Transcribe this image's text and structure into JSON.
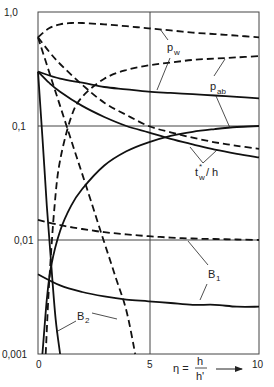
{
  "chart_data": {
    "type": "line",
    "title": "",
    "xlabel": "η = h/h'",
    "ylabel": "",
    "xscale": "linear",
    "yscale": "log",
    "xlim": [
      0,
      10
    ],
    "ylim": [
      0.001,
      1.0
    ],
    "grid": true,
    "x_ticks": [
      "0",
      "5",
      "10"
    ],
    "y_ticks": [
      "0,001",
      "0,01",
      "0,1",
      "1,0"
    ],
    "series": [
      {
        "name": "p_w (dashed)",
        "style": "dashed",
        "x": [
          0,
          0.5,
          1,
          1.5,
          2,
          3,
          4,
          5,
          6,
          7,
          8,
          9,
          10
        ],
        "values": [
          0.6,
          0.72,
          0.78,
          0.8,
          0.8,
          0.78,
          0.75,
          0.72,
          0.69,
          0.66,
          0.64,
          0.62,
          0.6
        ]
      },
      {
        "name": "p_w (solid)",
        "style": "solid",
        "x": [
          0,
          1,
          2,
          3,
          4,
          5,
          6,
          7,
          8,
          9,
          10
        ],
        "values": [
          0.3,
          0.26,
          0.24,
          0.22,
          0.21,
          0.2,
          0.195,
          0.19,
          0.185,
          0.18,
          0.175
        ]
      },
      {
        "name": "p_ab (dashed)",
        "style": "dashed",
        "x": [
          0.35,
          0.5,
          0.75,
          1,
          1.5,
          2,
          3,
          4,
          5,
          6,
          7,
          8,
          9,
          10
        ],
        "values": [
          0.001,
          0.004,
          0.02,
          0.05,
          0.12,
          0.18,
          0.26,
          0.31,
          0.34,
          0.36,
          0.38,
          0.39,
          0.4,
          0.41
        ]
      },
      {
        "name": "p_ab (solid)",
        "style": "solid",
        "x": [
          0.2,
          0.4,
          0.6,
          1,
          1.5,
          2,
          3,
          4,
          5,
          6,
          7,
          8,
          9,
          10
        ],
        "values": [
          0.001,
          0.003,
          0.006,
          0.012,
          0.02,
          0.028,
          0.045,
          0.06,
          0.072,
          0.082,
          0.089,
          0.094,
          0.098,
          0.1
        ]
      },
      {
        "name": "t_w*/h (dashed)",
        "style": "dashed",
        "x": [
          0,
          0.5,
          1,
          2,
          3,
          4,
          5,
          6,
          7,
          8,
          9,
          10
        ],
        "values": [
          0.6,
          0.45,
          0.35,
          0.23,
          0.16,
          0.125,
          0.1,
          0.088,
          0.079,
          0.072,
          0.067,
          0.063
        ]
      },
      {
        "name": "t_w*/h (solid)",
        "style": "solid",
        "x": [
          0,
          0.5,
          1,
          2,
          3,
          4,
          5,
          6,
          7,
          8,
          9,
          10
        ],
        "values": [
          0.3,
          0.24,
          0.2,
          0.15,
          0.12,
          0.1,
          0.088,
          0.077,
          0.069,
          0.062,
          0.057,
          0.053
        ]
      },
      {
        "name": "B1 (dashed)",
        "style": "dashed",
        "x": [
          0,
          1,
          2,
          3,
          4,
          5,
          6,
          7,
          8,
          9,
          10
        ],
        "values": [
          0.015,
          0.0135,
          0.0125,
          0.0117,
          0.0112,
          0.0108,
          0.0105,
          0.0103,
          0.0102,
          0.0101,
          0.01
        ]
      },
      {
        "name": "B1 (solid)",
        "style": "solid",
        "x": [
          0,
          1,
          2,
          3,
          4,
          5,
          6,
          7,
          8,
          9,
          10
        ],
        "values": [
          0.005,
          0.004,
          0.0035,
          0.0032,
          0.003,
          0.0029,
          0.0028,
          0.0027,
          0.0027,
          0.0026,
          0.0026
        ]
      },
      {
        "name": "B2 (solid)",
        "style": "solid",
        "x": [
          0,
          0.2,
          0.4,
          0.6,
          0.8,
          1.0
        ],
        "values": [
          0.3,
          0.08,
          0.02,
          0.006,
          0.002,
          0.001
        ]
      },
      {
        "name": "B2 (dashed)",
        "style": "dashed",
        "x": [
          0,
          0.5,
          1,
          1.5,
          2,
          2.5,
          3,
          3.5,
          4,
          4.4
        ],
        "values": [
          0.6,
          0.3,
          0.15,
          0.075,
          0.038,
          0.019,
          0.0095,
          0.0048,
          0.0024,
          0.001
        ]
      }
    ],
    "annotations": [
      {
        "text": "p_w",
        "points_to": [
          "p_w (dashed)",
          "p_w (solid)"
        ]
      },
      {
        "text": "p_ab",
        "points_to": [
          "p_ab (dashed)",
          "p_ab (solid)"
        ]
      },
      {
        "text": "t_w*/h",
        "points_to": [
          "t_w*/h (dashed)",
          "t_w*/h (solid)"
        ]
      },
      {
        "text": "B1",
        "points_to": [
          "B1 (dashed)",
          "B1 (solid)"
        ]
      },
      {
        "text": "B2",
        "points_to": [
          "B2 (solid)",
          "B2 (dashed)"
        ]
      }
    ]
  },
  "axes": {
    "y_tick_labels": [
      "1,0",
      "0,1",
      "0,01",
      "0,001"
    ],
    "x_tick_labels": [
      "0",
      "5",
      "10"
    ],
    "x_label_eta": "η =",
    "x_label_num": "h",
    "x_label_den": "h'"
  },
  "labels": {
    "pw_main": "p",
    "pw_sub": "w",
    "pab_main": "p",
    "pab_sub": "ab",
    "tw_main": "t",
    "tw_sup": "*",
    "tw_sub": "w",
    "tw_rest": "/ h",
    "b1_main": "B",
    "b1_sub": "1",
    "b2_main": "B",
    "b2_sub": "2"
  }
}
